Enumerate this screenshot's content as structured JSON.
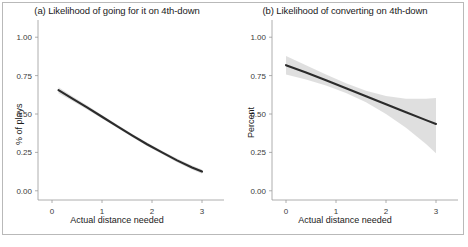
{
  "figure": {
    "width": 468,
    "height": 247,
    "background": "#ffffff",
    "frame_color": "#b9b9b9",
    "line_color": "#2b2b2b",
    "band_color": "#d3d3d3"
  },
  "chart_data": [
    {
      "type": "line",
      "panel": "a",
      "title": "(a) Likelihood of going for it on 4th-down",
      "xlabel": "Actual distance needed",
      "ylabel": "% of plays",
      "xlim": [
        -0.28,
        3.28
      ],
      "ylim": [
        -0.06,
        1.06
      ],
      "xticks": [
        0,
        1,
        2,
        3
      ],
      "xticklabels": [
        "0",
        "1",
        "2",
        "3"
      ],
      "yticks": [
        0.0,
        0.25,
        0.5,
        0.75,
        1.0
      ],
      "yticklabels": [
        "0.00",
        "0.25",
        "0.50",
        "0.75",
        "1.00"
      ],
      "grid": false,
      "legend": "none",
      "series": [
        {
          "name": "fitted",
          "x": [
            0.13,
            0.4,
            0.7,
            1.0,
            1.3,
            1.6,
            1.9,
            2.2,
            2.5,
            2.8,
            3.0
          ],
          "y": [
            0.655,
            0.602,
            0.543,
            0.482,
            0.421,
            0.361,
            0.303,
            0.25,
            0.198,
            0.152,
            0.125
          ]
        }
      ],
      "confidence_band": {
        "x": [
          0.13,
          0.4,
          0.7,
          1.0,
          1.3,
          1.6,
          1.9,
          2.2,
          2.5,
          2.8,
          3.0
        ],
        "lower": [
          0.635,
          0.586,
          0.529,
          0.47,
          0.41,
          0.35,
          0.292,
          0.239,
          0.186,
          0.139,
          0.111
        ],
        "upper": [
          0.675,
          0.618,
          0.557,
          0.494,
          0.432,
          0.372,
          0.314,
          0.261,
          0.21,
          0.165,
          0.139
        ]
      }
    },
    {
      "type": "line",
      "panel": "b",
      "title": "(b) Likelihood of converting on 4th-down",
      "xlabel": "Actual distance needed",
      "ylabel": "Percent",
      "xlim": [
        -0.28,
        3.28
      ],
      "ylim": [
        -0.06,
        1.06
      ],
      "xticks": [
        0,
        1,
        2,
        3
      ],
      "xticklabels": [
        "0",
        "1",
        "2",
        "3"
      ],
      "yticks": [
        0.0,
        0.25,
        0.5,
        0.75,
        1.0
      ],
      "yticklabels": [
        "0.00",
        "0.25",
        "0.50",
        "0.75",
        "1.00"
      ],
      "grid": false,
      "legend": "none",
      "series": [
        {
          "name": "fitted",
          "x": [
            0.0,
            0.4,
            0.8,
            1.2,
            1.6,
            2.0,
            2.4,
            2.8,
            3.0
          ],
          "y": [
            0.818,
            0.77,
            0.72,
            0.668,
            0.616,
            0.564,
            0.512,
            0.46,
            0.435
          ]
        }
      ],
      "confidence_band": {
        "x": [
          0.0,
          0.4,
          0.8,
          1.2,
          1.6,
          2.0,
          2.4,
          2.8,
          3.0
        ],
        "lower": [
          0.757,
          0.724,
          0.685,
          0.636,
          0.576,
          0.5,
          0.41,
          0.305,
          0.245
        ],
        "upper": [
          0.878,
          0.818,
          0.757,
          0.7,
          0.652,
          0.617,
          0.6,
          0.6,
          0.605
        ]
      }
    }
  ]
}
